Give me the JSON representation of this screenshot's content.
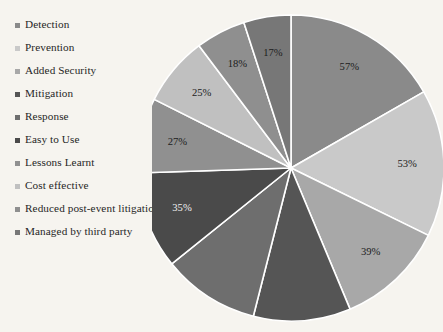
{
  "legend": {
    "items": [
      {
        "label": "Detection",
        "color": "#8a8a8a"
      },
      {
        "label": "Prevention",
        "color": "#c9c9c9"
      },
      {
        "label": "Added Security",
        "color": "#a8a8a8"
      },
      {
        "label": "Mitigation",
        "color": "#555555"
      },
      {
        "label": "Response",
        "color": "#6e6e6e"
      },
      {
        "label": "Easy to Use",
        "color": "#4a4a4a"
      },
      {
        "label": "Lessons Learnt",
        "color": "#909090"
      },
      {
        "label": "Cost effective",
        "color": "#c0c0c0"
      },
      {
        "label": "Reduced post-event litigation",
        "color": "#8f8f8f"
      },
      {
        "label": "Managed by third party",
        "color": "#777777"
      }
    ]
  },
  "chart_data": {
    "type": "pie",
    "title": "",
    "legend_position": "left",
    "start_angle_deg": 0,
    "direction": "clockwise",
    "background": "#f6f4ef",
    "separator_color": "#ffffff",
    "categories": [
      "Detection",
      "Prevention",
      "Added Security",
      "Mitigation",
      "Response",
      "Easy to Use",
      "Lessons Learnt",
      "Cost effective",
      "Reduced post-event litigation",
      "Managed by third party"
    ],
    "values": [
      57,
      53,
      39,
      35,
      35,
      35,
      27,
      25,
      18,
      17
    ],
    "labels": [
      "57%",
      "53%",
      "39%",
      "35%",
      "35%",
      "35%",
      "27%",
      "25%",
      "18%",
      "17%"
    ],
    "label_visible": [
      true,
      true,
      true,
      false,
      false,
      true,
      true,
      true,
      true,
      true
    ],
    "colors": [
      "#8a8a8a",
      "#c9c9c9",
      "#a8a8a8",
      "#555555",
      "#6e6e6e",
      "#4a4a4a",
      "#909090",
      "#c0c0c0",
      "#8f8f8f",
      "#777777"
    ],
    "label_on_dark": [
      false,
      false,
      false,
      true,
      true,
      true,
      false,
      false,
      false,
      false
    ],
    "note": "Values are response percentages; they sum to more than 100 because respondents could select multiple options. Two slices at the bottom of the pie are clipped by the image edge and their data labels are not legible."
  }
}
